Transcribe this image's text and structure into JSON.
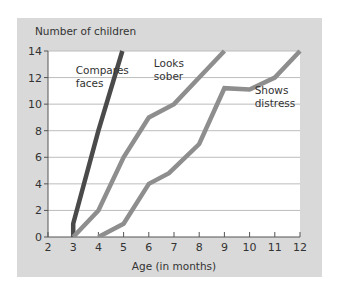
{
  "chart_data": {
    "type": "line",
    "title": "",
    "ylabel": "Number of children",
    "xlabel": "Age (in months)",
    "xlim": [
      2,
      12
    ],
    "ylim": [
      0,
      14
    ],
    "xticks": [
      2,
      3,
      4,
      5,
      6,
      7,
      8,
      9,
      10,
      11,
      12
    ],
    "yticks": [
      0,
      2,
      4,
      6,
      8,
      10,
      12,
      14
    ],
    "grid": "horizontal",
    "legend": "inline annotations",
    "series": [
      {
        "name": "Compares faces",
        "color": "#4a4a4a",
        "points": [
          [
            3,
            0
          ],
          [
            3,
            1
          ],
          [
            4,
            8
          ],
          [
            4.95,
            14
          ]
        ],
        "label_pos": [
          3.1,
          12.3
        ]
      },
      {
        "name": "Looks sober",
        "color": "#8e8e8e",
        "points": [
          [
            3,
            0
          ],
          [
            4,
            2
          ],
          [
            5,
            6
          ],
          [
            6,
            9
          ],
          [
            7,
            10
          ],
          [
            8,
            12
          ],
          [
            9,
            14
          ]
        ],
        "label_pos": [
          6.2,
          12.8
        ]
      },
      {
        "name": "Shows distress",
        "color": "#8e8e8e",
        "points": [
          [
            4,
            0
          ],
          [
            5,
            1
          ],
          [
            6,
            4
          ],
          [
            6.8,
            4.8
          ],
          [
            8,
            7
          ],
          [
            9,
            11.2
          ],
          [
            10,
            11.1
          ],
          [
            11,
            12
          ],
          [
            12,
            14
          ]
        ],
        "label_pos": [
          10.2,
          10.8
        ]
      }
    ]
  },
  "labels": {
    "ylabel": "Number of children",
    "xlabel": "Age (in months)",
    "series_labels": [
      [
        "Compares",
        "faces"
      ],
      [
        "Looks",
        "sober"
      ],
      [
        "Shows",
        "distress"
      ]
    ]
  },
  "colors": {
    "panel": "#d9d9d9",
    "plot": "#ffffff",
    "grid": "#bdbdbd",
    "axis": "#555555",
    "dark_line": "#4a4a4a",
    "light_line": "#8e8e8e"
  }
}
